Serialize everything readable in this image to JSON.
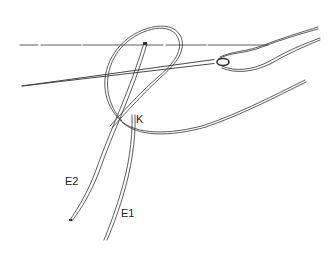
{
  "figure": {
    "type": "line-drawing",
    "labels": {
      "knot": "K",
      "end1": "E1",
      "end2": "E2"
    },
    "colors": {
      "ink": "#333333",
      "background": "#ffffff"
    }
  }
}
